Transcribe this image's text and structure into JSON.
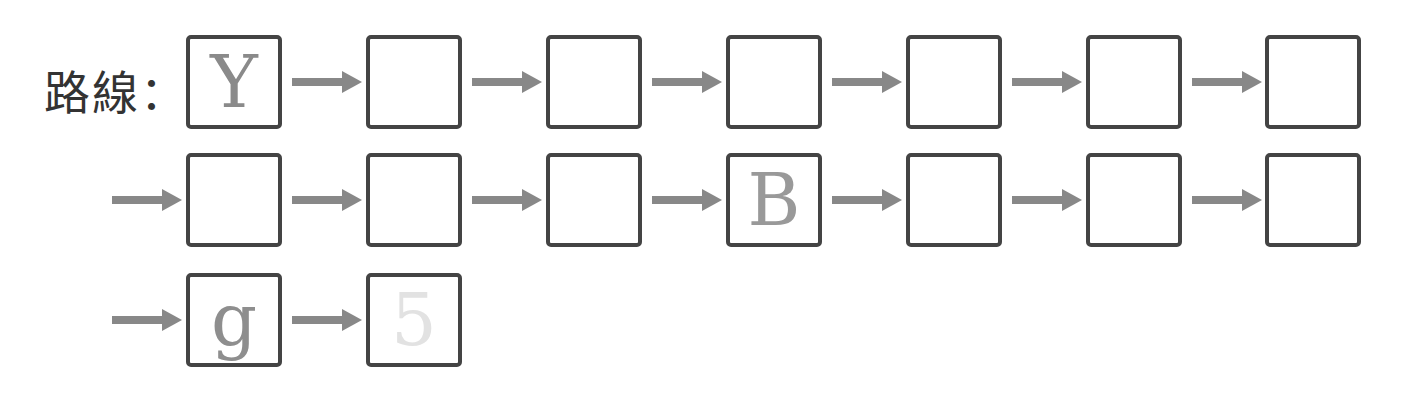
{
  "title_label": "路線：",
  "colors": {
    "border": "#444444",
    "arrow": "#888888"
  },
  "rows": [
    {
      "leading_arrow": false,
      "cells": [
        {
          "value": "Y",
          "color": "#8a8a8a"
        },
        {
          "value": "",
          "color": "#888"
        },
        {
          "value": "",
          "color": "#888"
        },
        {
          "value": "",
          "color": "#888"
        },
        {
          "value": "",
          "color": "#888"
        },
        {
          "value": "",
          "color": "#888"
        },
        {
          "value": "",
          "color": "#888"
        }
      ]
    },
    {
      "leading_arrow": true,
      "cells": [
        {
          "value": "",
          "color": "#888"
        },
        {
          "value": "",
          "color": "#888"
        },
        {
          "value": "",
          "color": "#888"
        },
        {
          "value": "B",
          "color": "#999999"
        },
        {
          "value": "",
          "color": "#888"
        },
        {
          "value": "",
          "color": "#888"
        },
        {
          "value": "",
          "color": "#888"
        }
      ]
    },
    {
      "leading_arrow": true,
      "cells": [
        {
          "value": "g",
          "color": "#8e8e8e"
        },
        {
          "value": "5",
          "color": "#e2e2e2"
        }
      ]
    }
  ]
}
